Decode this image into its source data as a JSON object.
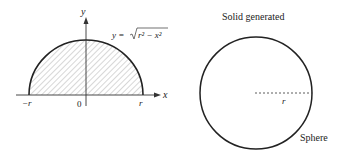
{
  "left_panel": {
    "axis_labels": {
      "x": "x",
      "y": "y"
    },
    "tick_labels": {
      "neg_r": "−r",
      "origin": "0",
      "pos_r": "r"
    },
    "curve_equation": {
      "lhs": "y = ",
      "radicand": "r² − x²",
      "full": "y = √(r² − x²)"
    },
    "region": "shaded semicircle (hatched)"
  },
  "right_panel": {
    "title": "Solid generated",
    "radius_label": "r",
    "shape_label": "Sphere"
  },
  "colors": {
    "stroke": "#222222",
    "hatch": "#888888",
    "background": "#ffffff"
  }
}
